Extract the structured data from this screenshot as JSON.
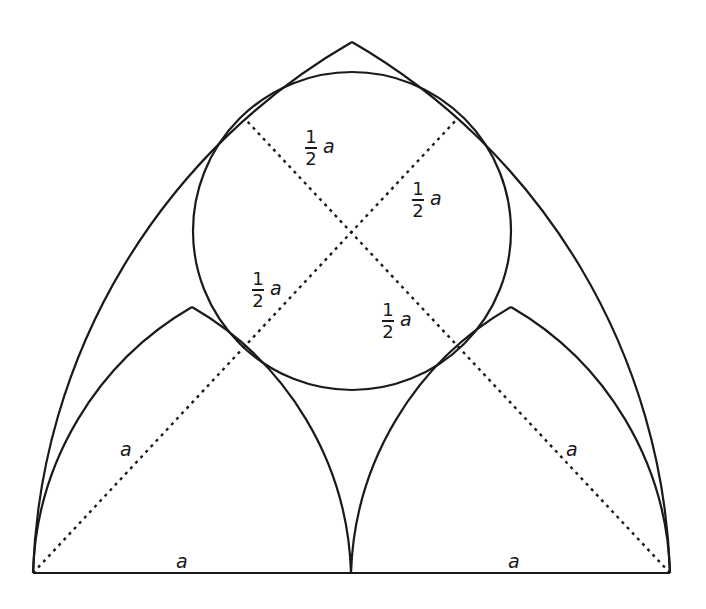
{
  "diagram": {
    "stroke_color": "#1a1a1a",
    "background": "#ffffff",
    "labels": {
      "half_a_upper_left": {
        "num": "1",
        "den": "2",
        "var": "a"
      },
      "half_a_upper_right": {
        "num": "1",
        "den": "2",
        "var": "a"
      },
      "half_a_lower_left": {
        "num": "1",
        "den": "2",
        "var": "a"
      },
      "half_a_lower_right": {
        "num": "1",
        "den": "2",
        "var": "a"
      },
      "a_left_radius": "a",
      "a_right_radius": "a",
      "a_base_left": "a",
      "a_base_right": "a"
    }
  }
}
